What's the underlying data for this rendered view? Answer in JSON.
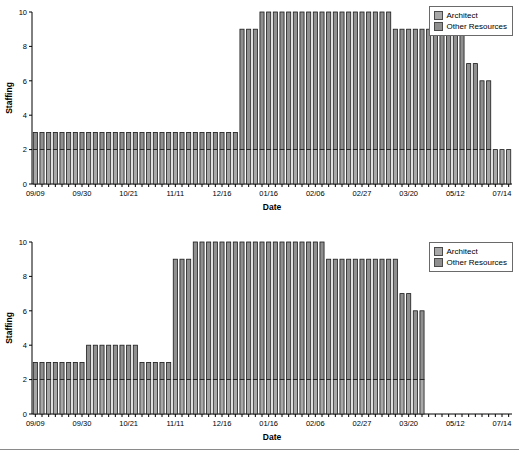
{
  "figure": {
    "background": "#ffffff",
    "accent_architect": "#a8a8a8",
    "accent_other": "#8f8f8f",
    "border_color": "#1a1a1a"
  },
  "legend": {
    "items": [
      {
        "label": "Architect",
        "color": "#a8a8a8",
        "swatch_name": "legend-swatch-architect"
      },
      {
        "label": "Other Resources",
        "color": "#8f8f8f",
        "swatch_name": "legend-swatch-other"
      }
    ]
  },
  "chart_data": [
    {
      "id": "staffing-chart-top",
      "type": "bar",
      "stacked": true,
      "title": "",
      "xlabel": "Date",
      "ylabel": "Staffing",
      "ylim": [
        0,
        10
      ],
      "yticks": [
        0,
        2,
        4,
        6,
        8,
        10
      ],
      "grid": false,
      "legend_position": "top-right",
      "tick_labels": [
        "09/09",
        "09/30",
        "10/21",
        "11/11",
        "12/16",
        "01/16",
        "02/06",
        "02/27",
        "03/20",
        "05/12",
        "07/14"
      ],
      "tick_label_indices": [
        0,
        7,
        14,
        21,
        28,
        35,
        42,
        49,
        56,
        63,
        70
      ],
      "n_bars": 72,
      "series": [
        {
          "name": "Architect",
          "color": "#a8a8a8",
          "values": [
            2,
            2,
            2,
            2,
            2,
            2,
            2,
            2,
            2,
            2,
            2,
            2,
            2,
            2,
            2,
            2,
            2,
            2,
            2,
            2,
            2,
            2,
            2,
            2,
            2,
            2,
            2,
            2,
            2,
            2,
            2,
            2,
            2,
            2,
            2,
            2,
            2,
            2,
            2,
            2,
            2,
            2,
            2,
            2,
            2,
            2,
            2,
            2,
            2,
            2,
            2,
            2,
            2,
            2,
            2,
            2,
            2,
            2,
            2,
            2,
            2,
            2,
            2,
            2,
            2,
            2,
            2,
            2,
            2,
            2,
            2,
            2
          ]
        },
        {
          "name": "Other Resources",
          "color": "#8f8f8f",
          "values": [
            1,
            1,
            1,
            1,
            1,
            1,
            1,
            1,
            1,
            1,
            1,
            1,
            1,
            1,
            1,
            1,
            1,
            1,
            1,
            1,
            1,
            1,
            1,
            1,
            1,
            1,
            1,
            1,
            1,
            1,
            1,
            7,
            7,
            7,
            8,
            8,
            8,
            8,
            8,
            8,
            8,
            8,
            8,
            8,
            8,
            8,
            8,
            8,
            8,
            8,
            8,
            8,
            8,
            8,
            7,
            7,
            7,
            7,
            7,
            7,
            7,
            7,
            7,
            7,
            7,
            5,
            5,
            4,
            4
          ]
        }
      ],
      "totals": [
        3,
        3,
        3,
        3,
        3,
        3,
        3,
        3,
        3,
        3,
        3,
        3,
        3,
        3,
        3,
        3,
        3,
        3,
        3,
        3,
        3,
        3,
        3,
        3,
        3,
        3,
        3,
        3,
        3,
        3,
        3,
        9,
        9,
        9,
        10,
        10,
        10,
        10,
        10,
        10,
        10,
        10,
        10,
        10,
        10,
        10,
        10,
        10,
        10,
        10,
        10,
        10,
        10,
        10,
        9,
        9,
        9,
        9,
        9,
        9,
        9,
        9,
        9,
        9,
        9,
        7,
        7,
        6,
        6
      ]
    },
    {
      "id": "staffing-chart-bottom",
      "type": "bar",
      "stacked": true,
      "title": "",
      "xlabel": "Date",
      "ylabel": "Staffing",
      "ylim": [
        0,
        10
      ],
      "yticks": [
        0,
        2,
        4,
        6,
        8,
        10
      ],
      "grid": false,
      "legend_position": "top-right",
      "tick_labels": [
        "09/09",
        "09/30",
        "10/21",
        "11/11",
        "12/16",
        "01/16",
        "02/06",
        "02/27",
        "03/20",
        "05/12",
        "07/14"
      ],
      "tick_label_indices": [
        0,
        7,
        14,
        21,
        28,
        35,
        42,
        49,
        56,
        63,
        70
      ],
      "n_bars": 59,
      "series": [
        {
          "name": "Architect",
          "color": "#a8a8a8",
          "values": [
            2,
            2,
            2,
            2,
            2,
            2,
            2,
            2,
            2,
            2,
            2,
            2,
            2,
            2,
            2,
            2,
            2,
            2,
            2,
            2,
            2,
            2,
            2,
            2,
            2,
            2,
            2,
            2,
            2,
            2,
            2,
            2,
            2,
            2,
            2,
            2,
            2,
            2,
            2,
            2,
            2,
            2,
            2,
            2,
            2,
            2,
            2,
            2,
            2,
            2,
            2,
            2,
            2,
            2,
            2,
            2,
            2,
            2,
            2,
            2
          ]
        },
        {
          "name": "Other Resources",
          "color": "#8f8f8f",
          "values": [
            1,
            1,
            1,
            1,
            1,
            1,
            1,
            1,
            2,
            2,
            2,
            2,
            2,
            2,
            2,
            2,
            1,
            1,
            1,
            1,
            1,
            7,
            7,
            7,
            8,
            8,
            8,
            8,
            8,
            8,
            8,
            8,
            8,
            8,
            8,
            8,
            8,
            8,
            8,
            8,
            8,
            8,
            8,
            8,
            7,
            7,
            7,
            7,
            7,
            7,
            7,
            7,
            7,
            7,
            7,
            5,
            5,
            4,
            4
          ]
        }
      ],
      "totals": [
        3,
        3,
        3,
        3,
        3,
        3,
        3,
        3,
        4,
        4,
        4,
        4,
        4,
        4,
        4,
        4,
        3,
        3,
        3,
        3,
        3,
        9,
        9,
        9,
        10,
        10,
        10,
        10,
        10,
        10,
        10,
        10,
        10,
        10,
        10,
        10,
        10,
        10,
        10,
        10,
        10,
        10,
        10,
        10,
        9,
        9,
        9,
        9,
        9,
        9,
        9,
        9,
        9,
        9,
        9,
        7,
        7,
        6,
        6
      ]
    }
  ]
}
